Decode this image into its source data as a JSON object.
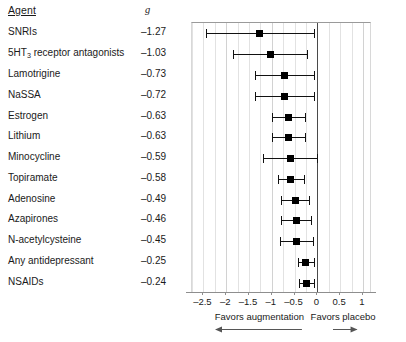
{
  "table": {
    "header_agent": "Agent",
    "header_effect": "g"
  },
  "axis": {
    "ticks": [
      "–2.5",
      "–2",
      "–1.5",
      "–1",
      "–0.5",
      "0",
      "0.5",
      "1"
    ],
    "tick_values": [
      -2.5,
      -2,
      -1.5,
      -1,
      -0.5,
      0,
      0.5,
      1
    ],
    "xmin": -2.75,
    "xmax": 1.2
  },
  "footer": {
    "left_label": "Favors augmentation",
    "right_label": "Favors placebo",
    "left_arrow_icon": "arrow-left-icon",
    "right_arrow_icon": "arrow-right-icon"
  },
  "colors": {
    "marker": "#000000",
    "line": "#111111",
    "grid": "#e2e2e2",
    "zero_line": "#4a4a4a",
    "axis": "#8e8e8e",
    "text": "#1a1a1a"
  },
  "chart_data": {
    "type": "scatter",
    "subtype": "forest-plot",
    "title": "",
    "xlabel": "",
    "ylabel": "",
    "xlim": [
      -2.75,
      1.2
    ],
    "grid": true,
    "legend": null,
    "reference_line": 0,
    "x_ticks": [
      -2.5,
      -2,
      -1.5,
      -1,
      -0.5,
      0,
      0.5,
      1
    ],
    "x_tick_labels": [
      "–2.5",
      "–2",
      "–1.5",
      "–1",
      "–0.5",
      "0",
      "0.5",
      "1"
    ],
    "annotations": [
      "Favors augmentation",
      "Favors placebo"
    ],
    "columns": [
      "Agent",
      "g"
    ],
    "categories": [
      "SNRIs",
      "5HT3 receptor antagonists",
      "Lamotrigine",
      "NaSSA",
      "Estrogen",
      "Lithium",
      "Minocycline",
      "Topiramate",
      "Adenosine",
      "Azapirones",
      "N-acetylcysteine",
      "Any antidepressant",
      "NSAIDs"
    ],
    "values": [
      -1.27,
      -1.03,
      -0.73,
      -0.72,
      -0.63,
      -0.63,
      -0.59,
      -0.58,
      -0.49,
      -0.46,
      -0.45,
      -0.25,
      -0.24
    ],
    "ci_low": [
      -2.45,
      -1.85,
      -1.36,
      -1.36,
      -1.0,
      -1.0,
      -1.2,
      -0.86,
      -0.8,
      -0.79,
      -0.81,
      -0.43,
      -0.41
    ],
    "ci_high": [
      -0.08,
      -0.22,
      -0.07,
      -0.07,
      -0.27,
      -0.27,
      0.0,
      -0.3,
      -0.18,
      -0.13,
      -0.09,
      -0.07,
      -0.07
    ],
    "rows": [
      {
        "agent": "SNRIs",
        "agent_sub": "",
        "agent_tail": "",
        "g": "–1.27",
        "value": -1.27,
        "low": -2.45,
        "high": -0.08
      },
      {
        "agent": "5HT",
        "agent_sub": "3",
        "agent_tail": " receptor antagonists",
        "g": "–1.03",
        "value": -1.03,
        "low": -1.85,
        "high": -0.22
      },
      {
        "agent": "Lamotrigine",
        "agent_sub": "",
        "agent_tail": "",
        "g": "–0.73",
        "value": -0.73,
        "low": -1.36,
        "high": -0.07
      },
      {
        "agent": "NaSSA",
        "agent_sub": "",
        "agent_tail": "",
        "g": "–0.72",
        "value": -0.72,
        "low": -1.36,
        "high": -0.07
      },
      {
        "agent": "Estrogen",
        "agent_sub": "",
        "agent_tail": "",
        "g": "–0.63",
        "value": -0.63,
        "low": -1.0,
        "high": -0.27
      },
      {
        "agent": "Lithium",
        "agent_sub": "",
        "agent_tail": "",
        "g": "–0.63",
        "value": -0.63,
        "low": -1.0,
        "high": -0.27
      },
      {
        "agent": "Minocycline",
        "agent_sub": "",
        "agent_tail": "",
        "g": "–0.59",
        "value": -0.59,
        "low": -1.2,
        "high": 0.0
      },
      {
        "agent": "Topiramate",
        "agent_sub": "",
        "agent_tail": "",
        "g": "–0.58",
        "value": -0.58,
        "low": -0.86,
        "high": -0.3
      },
      {
        "agent": "Adenosine",
        "agent_sub": "",
        "agent_tail": "",
        "g": "–0.49",
        "value": -0.49,
        "low": -0.8,
        "high": -0.18
      },
      {
        "agent": "Azapirones",
        "agent_sub": "",
        "agent_tail": "",
        "g": "–0.46",
        "value": -0.46,
        "low": -0.79,
        "high": -0.13
      },
      {
        "agent": "N-acetylcysteine",
        "agent_sub": "",
        "agent_tail": "",
        "g": "–0.45",
        "value": -0.45,
        "low": -0.81,
        "high": -0.09
      },
      {
        "agent": "Any antidepressant",
        "agent_sub": "",
        "agent_tail": "",
        "g": "–0.25",
        "value": -0.25,
        "low": -0.43,
        "high": -0.07
      },
      {
        "agent": "NSAIDs",
        "agent_sub": "",
        "agent_tail": "",
        "g": "–0.24",
        "value": -0.24,
        "low": -0.41,
        "high": -0.07
      }
    ]
  }
}
